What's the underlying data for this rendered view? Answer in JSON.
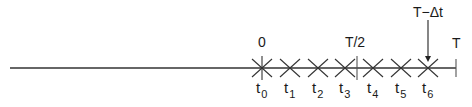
{
  "diagram": {
    "type": "time-axis",
    "colors": {
      "line": "#333333",
      "text": "#1a1a1a",
      "background": "#ffffff"
    },
    "axis": {
      "x_start": 10,
      "x_end": 456,
      "y": 68
    },
    "top_labels": {
      "origin": {
        "text": "0",
        "x": 258,
        "y": 47
      },
      "half": {
        "text": "T/2",
        "x": 355,
        "y": 47
      },
      "end": {
        "text": "T",
        "x": 452,
        "y": 48
      },
      "last_step": {
        "text": "T−Δt",
        "x": 428,
        "y": 17
      }
    },
    "ticks": {
      "half_x": 357,
      "end_x": 456
    },
    "arrow": {
      "x": 428,
      "y1": 20,
      "y2": 62
    },
    "time_points": [
      {
        "name": "t",
        "sub": "0",
        "x": 262,
        "origin": true
      },
      {
        "name": "t",
        "sub": "1",
        "x": 290
      },
      {
        "name": "t",
        "sub": "2",
        "x": 318
      },
      {
        "name": "t",
        "sub": "3",
        "x": 345
      },
      {
        "name": "t",
        "sub": "4",
        "x": 373
      },
      {
        "name": "t",
        "sub": "5",
        "x": 401
      },
      {
        "name": "t",
        "sub": "6",
        "x": 428
      }
    ]
  }
}
